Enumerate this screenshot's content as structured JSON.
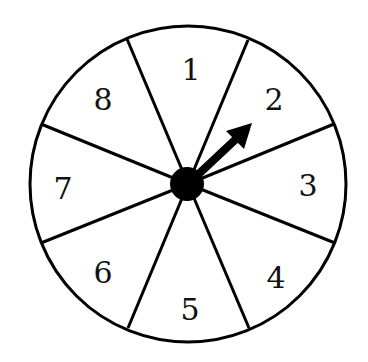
{
  "diagram": {
    "type": "spinner",
    "sections": [
      {
        "label": "1"
      },
      {
        "label": "2"
      },
      {
        "label": "3"
      },
      {
        "label": "4"
      },
      {
        "label": "5"
      },
      {
        "label": "6"
      },
      {
        "label": "7"
      },
      {
        "label": "8"
      }
    ],
    "pointer_section": "2",
    "colors": {
      "stroke": "#000000",
      "fill": "#ffffff"
    }
  }
}
